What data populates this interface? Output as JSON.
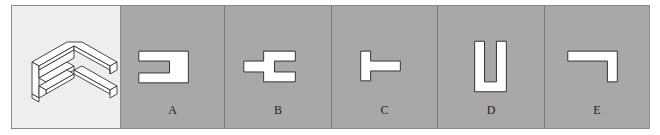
{
  "question_figure": {
    "description": "isometric 3D block figure (view to match)",
    "icon": "isometric-block-figure"
  },
  "options": [
    {
      "label": "A",
      "shape": "rectangle-with-left-notch"
    },
    {
      "label": "B",
      "shape": "stepped-fork-shape"
    },
    {
      "label": "C",
      "shape": "t-shape-rotated"
    },
    {
      "label": "D",
      "shape": "u-shape"
    },
    {
      "label": "E",
      "shape": "inverted-l-shape"
    }
  ],
  "colors": {
    "question_bg": "#eeeeee",
    "option_bg": "#a8a8a8",
    "shape_fill": "#ffffff",
    "stroke": "#333333"
  }
}
